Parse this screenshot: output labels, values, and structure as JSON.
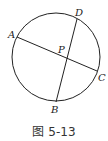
{
  "figure": {
    "caption": "图 5-13",
    "stroke_color": "#222222",
    "circle": {
      "cx": 56,
      "cy": 57,
      "r": 44
    },
    "points": {
      "A": {
        "label": "A",
        "x": 17,
        "y": 37,
        "lx": 8,
        "ly": 38
      },
      "D": {
        "label": "D",
        "x": 77,
        "y": 19,
        "lx": 75,
        "ly": 16
      },
      "C": {
        "label": "C",
        "x": 97,
        "y": 71,
        "lx": 98,
        "ly": 81
      },
      "B": {
        "label": "B",
        "x": 56,
        "y": 102,
        "lx": 51,
        "ly": 113
      },
      "P": {
        "label": "P",
        "x": 67,
        "y": 58,
        "lx": 58,
        "ly": 53
      }
    },
    "chords": [
      {
        "from": "A",
        "to": "C"
      },
      {
        "from": "D",
        "to": "B"
      }
    ]
  }
}
